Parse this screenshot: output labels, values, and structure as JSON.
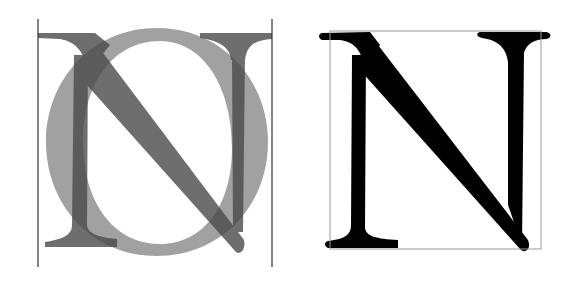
{
  "figure": {
    "left_panel": {
      "letters": [
        "N",
        "O"
      ],
      "guide_lines_x": [
        38,
        272
      ],
      "guide_line_color": "#333333",
      "n_color": "#555555",
      "o_color": "#8c8c8c",
      "opacity": 0.8
    },
    "right_panel": {
      "letter": "N",
      "letter_color": "#000000",
      "box_color": "#999999"
    }
  }
}
